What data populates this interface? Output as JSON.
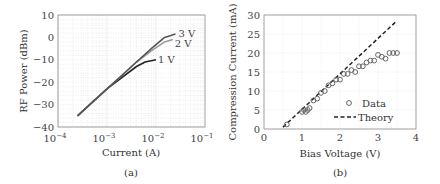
{
  "chart_data": [
    {
      "type": "line",
      "panel": "(a)",
      "title": "",
      "xlabel": "Current (A)",
      "ylabel": "RF Power (dBm)",
      "xscale": "log",
      "xlim": [
        0.0001,
        0.1
      ],
      "ylim": [
        -40,
        10
      ],
      "xticks": [
        "10^-4",
        "10^-3",
        "10^-2",
        "10^-1"
      ],
      "yticks": [
        10,
        0,
        -10,
        -20,
        -30,
        -40
      ],
      "grid": true,
      "series": [
        {
          "name": "1 V",
          "x": [
            0.00025,
            0.0005,
            0.001,
            0.002,
            0.004,
            0.006,
            0.01
          ],
          "y": [
            -35,
            -29,
            -23,
            -18,
            -13,
            -11,
            -10
          ]
        },
        {
          "name": "2 V",
          "x": [
            0.00025,
            0.0005,
            0.001,
            0.002,
            0.004,
            0.008,
            0.015,
            0.022
          ],
          "y": [
            -35,
            -29,
            -23,
            -17,
            -11,
            -6,
            -2,
            -1
          ]
        },
        {
          "name": "3 V",
          "x": [
            0.00025,
            0.0005,
            0.001,
            0.002,
            0.004,
            0.008,
            0.015,
            0.025
          ],
          "y": [
            -35,
            -29,
            -23,
            -17,
            -11,
            -5,
            0,
            1.5
          ]
        }
      ],
      "annotations": [
        "3 V",
        "2 V",
        "1 V"
      ]
    },
    {
      "type": "scatter",
      "panel": "(b)",
      "title": "",
      "xlabel": "Bias Voltage (V)",
      "ylabel": "Compression Current (mA)",
      "xlim": [
        0,
        4
      ],
      "ylim": [
        0,
        30
      ],
      "xticks": [
        0,
        1,
        2,
        3,
        4
      ],
      "yticks": [
        0,
        5,
        10,
        15,
        20,
        25,
        30
      ],
      "grid": true,
      "legend": {
        "position": "lower right",
        "entries": [
          "Data",
          "Theory"
        ]
      },
      "series": [
        {
          "name": "Data",
          "style": "circle",
          "x": [
            0.6,
            1.0,
            1.05,
            1.1,
            1.15,
            1.2,
            1.3,
            1.4,
            1.5,
            1.6,
            1.7,
            1.8,
            1.9,
            2.0,
            2.1,
            2.2,
            2.3,
            2.4,
            2.5,
            2.6,
            2.7,
            2.8,
            2.9,
            3.0,
            3.1,
            3.2,
            3.3,
            3.4,
            3.5
          ],
          "y": [
            1.2,
            4.5,
            5.0,
            4.5,
            5.0,
            5.5,
            7.5,
            8.0,
            9.5,
            10.0,
            11.5,
            12.0,
            13.0,
            13.0,
            14.5,
            14.5,
            15.5,
            15.0,
            16.5,
            16.5,
            17.5,
            18.0,
            18.0,
            19.5,
            19.0,
            18.5,
            20.0,
            20.0,
            20.0
          ]
        },
        {
          "name": "Theory",
          "style": "dashed",
          "x": [
            0.5,
            3.5
          ],
          "y": [
            0.5,
            28.5
          ]
        }
      ]
    }
  ],
  "labels": {
    "a": {
      "ylabel": "RF Power (dBm)",
      "xlabel": "Current (A)",
      "caption": "(a)",
      "yticks": [
        "10",
        "0",
        "−10",
        "−20",
        "−30",
        "−40"
      ],
      "xtick_base": "10",
      "xtick_exps": [
        "−4",
        "−3",
        "−2",
        "−1"
      ],
      "ann": [
        "3 V",
        "2 V",
        "1 V"
      ]
    },
    "b": {
      "ylabel": "Compression Current (mA)",
      "xlabel": "Bias Voltage (V)",
      "caption": "(b)",
      "yticks": [
        "30",
        "25",
        "20",
        "15",
        "10",
        "5",
        "0"
      ],
      "xticks": [
        "0",
        "1",
        "2",
        "3",
        "4"
      ],
      "legend_data": "Data",
      "legend_theory": "Theory"
    }
  },
  "colors": {
    "axis": "#888888",
    "grid": "#dddddd",
    "line_3v": "#555555",
    "line_2v": "#999999",
    "line_1v": "#222222",
    "marker": "#666666",
    "theory": "#222222"
  }
}
